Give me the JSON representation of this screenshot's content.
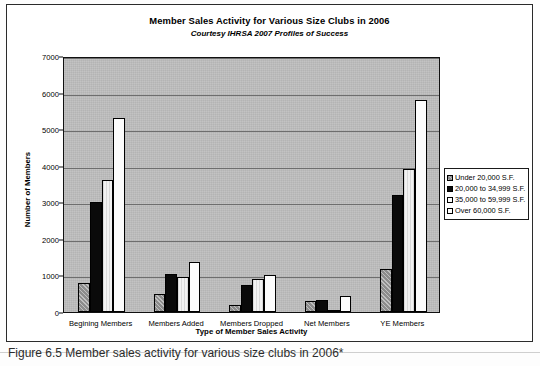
{
  "figure": {
    "caption": "Figure 6.5  Member sales activity for various size clubs in 2006*"
  },
  "chart_data": {
    "type": "bar",
    "title": "Member Sales Activity for Various Size Clubs in 2006",
    "subtitle": "Courtesy IHRSA 2007 Profiles of Success",
    "xlabel": "Type of Member Sales Activity",
    "ylabel": "Number of Members",
    "categories": [
      "Begining Members",
      "Members Added",
      "Members Dropped",
      "Net Members",
      "YE Members"
    ],
    "series": [
      {
        "name": "Under 20,000 S.F.",
        "values": [
          800,
          500,
          200,
          300,
          1180
        ]
      },
      {
        "name": "20,000 to 34,999 S.F.",
        "values": [
          3000,
          1050,
          750,
          330,
          3200
        ]
      },
      {
        "name": "35,000 to 59,999 S.F.",
        "values": [
          3600,
          950,
          900,
          50,
          3900
        ]
      },
      {
        "name": "Over 60,000 S.F.",
        "values": [
          5300,
          1380,
          1020,
          450,
          5800
        ]
      }
    ],
    "ylim": [
      0,
      7000
    ],
    "yticks": [
      "0",
      "1000",
      "2000",
      "3000",
      "4000",
      "5000",
      "6000",
      "7000"
    ],
    "grid": true,
    "legend_position": "right",
    "colors": {
      "series_0": "#8c8c8c",
      "series_1": "#0a0a0a",
      "series_2": "#f2f2f2",
      "series_3": "#fcfcfc",
      "plot_background": "#b4b4b4",
      "gridline": "#6e6e6e"
    }
  }
}
